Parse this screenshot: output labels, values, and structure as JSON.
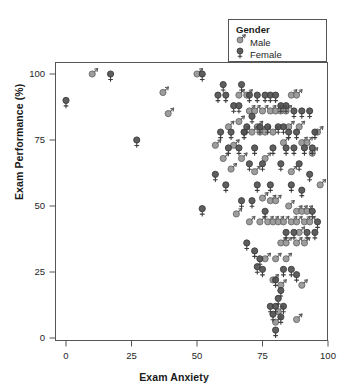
{
  "chart_data": {
    "type": "scatter",
    "title": "",
    "xlabel": "Exam Anxiety",
    "ylabel": "Exam Performance (%)",
    "xlim": [
      0,
      100
    ],
    "ylim": [
      0,
      100
    ],
    "xticks": [
      0,
      25,
      50,
      75,
      100
    ],
    "yticks": [
      0,
      25,
      50,
      75,
      100
    ],
    "grid": false,
    "legend": {
      "title": "Gender",
      "position": "top-right-inside",
      "entries": [
        {
          "name": "Male",
          "marker": "mars-symbol",
          "color": "#8c8c8c"
        },
        {
          "name": "Female",
          "marker": "venus-symbol",
          "color": "#4d4d4d"
        }
      ]
    },
    "series": [
      {
        "name": "Male",
        "color": "#8c8c8c",
        "points": [
          [
            10,
            100
          ],
          [
            37,
            93
          ],
          [
            50,
            100
          ],
          [
            39,
            85
          ],
          [
            57,
            73
          ],
          [
            62,
            80
          ],
          [
            66,
            92
          ],
          [
            69,
            92
          ],
          [
            70,
            86
          ],
          [
            72,
            86
          ],
          [
            73,
            80
          ],
          [
            75,
            86
          ],
          [
            78,
            86
          ],
          [
            80,
            86
          ],
          [
            82,
            86
          ],
          [
            84,
            86
          ],
          [
            86,
            92
          ],
          [
            88,
            92
          ],
          [
            85,
            80
          ],
          [
            89,
            80
          ],
          [
            66,
            82
          ],
          [
            64,
            73
          ],
          [
            68,
            78
          ],
          [
            71,
            78
          ],
          [
            74,
            78
          ],
          [
            76,
            78
          ],
          [
            79,
            78
          ],
          [
            83,
            74
          ],
          [
            90,
            74
          ],
          [
            92,
            74
          ],
          [
            60,
            68
          ],
          [
            67,
            68
          ],
          [
            76,
            68
          ],
          [
            63,
            64
          ],
          [
            72,
            63
          ],
          [
            86,
            63
          ],
          [
            94,
            70
          ],
          [
            96,
            78
          ],
          [
            97,
            58
          ],
          [
            75,
            53
          ],
          [
            78,
            52
          ],
          [
            80,
            52
          ],
          [
            85,
            50
          ],
          [
            88,
            48
          ],
          [
            90,
            48
          ],
          [
            92,
            48
          ],
          [
            74,
            44
          ],
          [
            77,
            44
          ],
          [
            79,
            44
          ],
          [
            81,
            44
          ],
          [
            83,
            44
          ],
          [
            86,
            44
          ],
          [
            88,
            44
          ],
          [
            91,
            44
          ],
          [
            93,
            44
          ],
          [
            89,
            40
          ],
          [
            70,
            44
          ],
          [
            65,
            47
          ],
          [
            82,
            36
          ],
          [
            84,
            36
          ],
          [
            88,
            36
          ],
          [
            91,
            36
          ],
          [
            76,
            30
          ],
          [
            80,
            30
          ],
          [
            84,
            30
          ],
          [
            79,
            22
          ],
          [
            82,
            20
          ],
          [
            90,
            20
          ],
          [
            81,
            10
          ],
          [
            80,
            6
          ],
          [
            88,
            7
          ]
        ]
      },
      {
        "name": "Female",
        "color": "#4d4d4d",
        "points": [
          [
            0,
            90
          ],
          [
            17,
            100
          ],
          [
            27,
            75
          ],
          [
            52,
            100
          ],
          [
            60,
            96
          ],
          [
            67,
            96
          ],
          [
            58,
            92
          ],
          [
            61,
            92
          ],
          [
            64,
            88
          ],
          [
            66,
            88
          ],
          [
            70,
            92
          ],
          [
            73,
            92
          ],
          [
            76,
            92
          ],
          [
            78,
            92
          ],
          [
            80,
            92
          ],
          [
            82,
            88
          ],
          [
            84,
            88
          ],
          [
            87,
            86
          ],
          [
            71,
            84
          ],
          [
            69,
            80
          ],
          [
            74,
            80
          ],
          [
            77,
            80
          ],
          [
            81,
            80
          ],
          [
            83,
            80
          ],
          [
            90,
            86
          ],
          [
            93,
            86
          ],
          [
            59,
            78
          ],
          [
            63,
            78
          ],
          [
            68,
            78
          ],
          [
            85,
            78
          ],
          [
            88,
            78
          ],
          [
            95,
            78
          ],
          [
            57,
            62
          ],
          [
            62,
            72
          ],
          [
            66,
            72
          ],
          [
            72,
            72
          ],
          [
            79,
            72
          ],
          [
            84,
            72
          ],
          [
            87,
            72
          ],
          [
            91,
            72
          ],
          [
            94,
            72
          ],
          [
            70,
            66
          ],
          [
            75,
            66
          ],
          [
            82,
            66
          ],
          [
            89,
            66
          ],
          [
            93,
            62
          ],
          [
            52,
            49
          ],
          [
            61,
            58
          ],
          [
            73,
            58
          ],
          [
            78,
            58
          ],
          [
            86,
            58
          ],
          [
            90,
            56
          ],
          [
            67,
            52
          ],
          [
            71,
            52
          ],
          [
            76,
            48
          ],
          [
            84,
            40
          ],
          [
            87,
            40
          ],
          [
            92,
            40
          ],
          [
            95,
            40
          ],
          [
            69,
            36
          ],
          [
            72,
            33
          ],
          [
            74,
            30
          ],
          [
            73,
            27
          ],
          [
            75,
            26
          ],
          [
            83,
            26
          ],
          [
            86,
            26
          ],
          [
            88,
            24
          ],
          [
            80,
            22
          ],
          [
            82,
            18
          ],
          [
            78,
            12
          ],
          [
            80,
            12
          ],
          [
            83,
            12
          ],
          [
            81,
            15
          ],
          [
            79,
            9
          ],
          [
            82,
            8
          ],
          [
            80,
            3
          ],
          [
            94,
            48
          ],
          [
            96,
            44
          ]
        ]
      }
    ]
  }
}
